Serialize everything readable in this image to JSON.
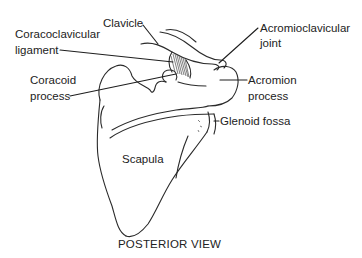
{
  "diagram": {
    "title": "POSTERIOR VIEW",
    "structure": "Scapula",
    "labels": {
      "clavicle": "Clavicle",
      "coracoclavicular_ligament_line1": "Coracoclavicular",
      "coracoclavicular_ligament_line2": "ligament",
      "coracoid_process_line1": "Coracoid",
      "coracoid_process_line2": "process",
      "acromioclavicular_joint_line1": "Acromioclavicular",
      "acromioclavicular_joint_line2": "joint",
      "acromion_process_line1": "Acromion",
      "acromion_process_line2": "process",
      "glenoid_fossa": "Glenoid fossa",
      "scapula": "Scapula"
    },
    "colors": {
      "background": "#ffffff",
      "line": "#2a2a2a",
      "text": "#222222"
    }
  }
}
